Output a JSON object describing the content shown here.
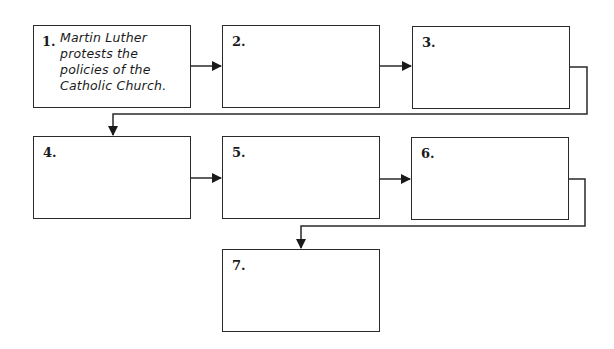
{
  "diagram": {
    "type": "sequence-flowchart",
    "line_color": "#2a2a2a",
    "boxes": [
      {
        "number": "1.",
        "text_lines": [
          "Martin Luther",
          "protests the",
          "policies of the",
          "Catholic Church."
        ]
      },
      {
        "number": "2.",
        "text_lines": []
      },
      {
        "number": "3.",
        "text_lines": []
      },
      {
        "number": "4.",
        "text_lines": []
      },
      {
        "number": "5.",
        "text_lines": []
      },
      {
        "number": "6.",
        "text_lines": []
      },
      {
        "number": "7.",
        "text_lines": []
      }
    ],
    "connections": [
      {
        "from": "1",
        "to": "2"
      },
      {
        "from": "2",
        "to": "3"
      },
      {
        "from": "3",
        "to": "4"
      },
      {
        "from": "4",
        "to": "5"
      },
      {
        "from": "5",
        "to": "6"
      },
      {
        "from": "6",
        "to": "7"
      }
    ]
  }
}
